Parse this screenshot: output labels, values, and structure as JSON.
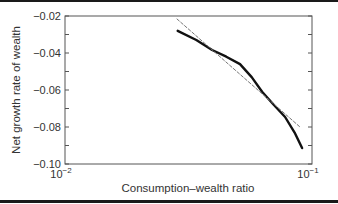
{
  "chart_data": {
    "type": "line",
    "title": "",
    "xlabel": "Consumption–wealth ratio",
    "ylabel": "Net growth rate of wealth",
    "xscale": "log",
    "xlim": [
      0.01,
      0.1
    ],
    "ylim": [
      -0.1,
      -0.02
    ],
    "x_tick_labels": [
      {
        "base": "10",
        "exp": "−2",
        "value": 0.01
      },
      {
        "base": "10",
        "exp": "−1",
        "value": 0.1
      }
    ],
    "y_tick_labels": [
      "−0.02",
      "−0.04",
      "−0.06",
      "−0.08",
      "−0.10"
    ],
    "y_ticks": [
      -0.02,
      -0.04,
      -0.06,
      -0.08,
      -0.1
    ],
    "y_minor_step": 0.01,
    "grid": false,
    "legend": null,
    "series": [
      {
        "name": "Net growth rate",
        "style": "solid",
        "color": "#111111",
        "x": [
          0.0286,
          0.034,
          0.0394,
          0.045,
          0.0511,
          0.057,
          0.0628,
          0.07,
          0.0778,
          0.085,
          0.0912
        ],
        "y": [
          -0.028,
          -0.033,
          -0.0384,
          -0.042,
          -0.046,
          -0.053,
          -0.061,
          -0.068,
          -0.0746,
          -0.083,
          -0.0914
        ]
      },
      {
        "name": "Linear approximation",
        "style": "dashed",
        "color": "#777777",
        "x": [
          0.0284,
          0.0894
        ],
        "y": [
          -0.0216,
          -0.08
        ]
      }
    ]
  }
}
